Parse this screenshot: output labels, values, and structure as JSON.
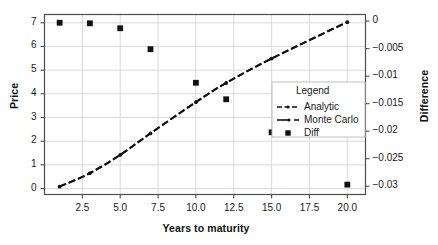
{
  "chart_data": {
    "type": "line",
    "title": "",
    "xlabel": "Years to maturity",
    "ylabel": "Price",
    "y2label": "Difference",
    "xlim": [
      0.0,
      21.2
    ],
    "ylim": [
      -0.25,
      7.35
    ],
    "y2lim": [
      -0.0315,
      0.0012
    ],
    "grid": true,
    "xticks": [
      2.5,
      5.0,
      7.5,
      10.0,
      12.5,
      15.0,
      17.5,
      20.0
    ],
    "xticklabels": [
      "2.5",
      "5.0",
      "7.5",
      "10.0",
      "12.5",
      "15.0",
      "17.5",
      "20.0"
    ],
    "yticks": [
      0,
      1,
      2,
      3,
      4,
      5,
      6,
      7
    ],
    "yticklabels": [
      "0",
      "1",
      "2",
      "3",
      "4",
      "5",
      "6",
      "7"
    ],
    "y2ticks": [
      0,
      -0.005,
      -0.01,
      -0.015,
      -0.02,
      -0.025,
      -0.03
    ],
    "y2ticklabels": [
      "0",
      "−0.005",
      "−0.01",
      "−0.015",
      "−0.02",
      "−0.025",
      "−0.03"
    ],
    "x": [
      1,
      3,
      5,
      7,
      10,
      12,
      15,
      20
    ],
    "series": [
      {
        "name": "Analytic",
        "axis": "left",
        "style": "dash-dot",
        "marker": "none",
        "color": "#111111",
        "values": [
          0.082,
          0.655,
          1.425,
          2.335,
          3.655,
          4.465,
          5.495,
          7.04
        ]
      },
      {
        "name": "Monte Carlo",
        "axis": "left",
        "style": "dashed",
        "marker": "dot",
        "color": "#111111",
        "values": [
          0.079,
          0.651,
          1.42,
          2.33,
          3.648,
          4.458,
          5.487,
          7.028
        ]
      },
      {
        "name": "Diff",
        "axis": "right",
        "style": "none",
        "marker": "square",
        "color": "#111111",
        "values": [
          -0.0003,
          -0.0004,
          -0.0013,
          -0.0051,
          -0.0112,
          -0.0142,
          -0.0202,
          -0.0297
        ]
      }
    ],
    "legend": {
      "title": "Legend",
      "position": "center-right",
      "entries": [
        {
          "label": "Analytic",
          "glyph": "dash-dot-line"
        },
        {
          "label": "Monte Carlo",
          "glyph": "line-dot-dash"
        },
        {
          "label": "Diff",
          "glyph": "square-marker"
        }
      ]
    },
    "colors": {
      "line": "#111111",
      "grid": "#d9d9d9",
      "frame": "#4d4d4d",
      "background": "#ffffff",
      "legend_border": "#bfbfbf"
    }
  }
}
